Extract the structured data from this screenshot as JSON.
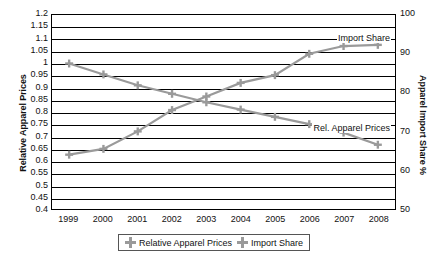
{
  "chart_data": {
    "type": "line",
    "title": "",
    "subtitle": "",
    "xlabel": "",
    "ylabel": "Relative Apparel Prices",
    "y2label": "Apparel Import Share %",
    "categories": [
      "1999",
      "2000",
      "2001",
      "2002",
      "2003",
      "2004",
      "2005",
      "2006",
      "2007",
      "2008"
    ],
    "x": [
      1999,
      2000,
      2001,
      2002,
      2003,
      2004,
      2005,
      2006,
      2007,
      2008
    ],
    "ylim": [
      0.4,
      1.2
    ],
    "y2lim": [
      50,
      100
    ],
    "ytick_step": 0.05,
    "y2tick_step": 10,
    "grid": true,
    "legend_position": "bottom",
    "series": [
      {
        "name": "Relative Apparel Prices",
        "axis": "left",
        "color": "#9a9a9a",
        "marker": "plus",
        "values": [
          1.0,
          0.955,
          0.91,
          0.875,
          0.84,
          0.81,
          0.78,
          0.75,
          0.715,
          0.665
        ]
      },
      {
        "name": "Import Share",
        "axis": "right",
        "color": "#9a9a9a",
        "marker": "plus",
        "values": [
          64.0,
          65.5,
          70.0,
          75.5,
          79.0,
          82.5,
          84.5,
          90.0,
          92.0,
          92.3
        ]
      }
    ],
    "annotations": [
      {
        "text": "Import Share",
        "series": "Import Share"
      },
      {
        "text": "Rel. Apparel Prices",
        "series": "Relative Apparel Prices"
      }
    ],
    "ytick_labels": [
      "1.2",
      "1.15",
      "1.1",
      "1.05",
      "1",
      "0.95",
      "0.9",
      "0.85",
      "0.8",
      "0.75",
      "0.7",
      "0.65",
      "0.6",
      "0.55",
      "0.5",
      "0.45",
      "0.4"
    ],
    "y2tick_labels": [
      "100",
      "90",
      "80",
      "70",
      "60",
      "50"
    ]
  },
  "legend": {
    "items": [
      {
        "label": "Relative Apparel Prices",
        "marker": "plus-marker-icon"
      },
      {
        "label": "Import Share",
        "marker": "plus-marker-icon"
      }
    ]
  }
}
